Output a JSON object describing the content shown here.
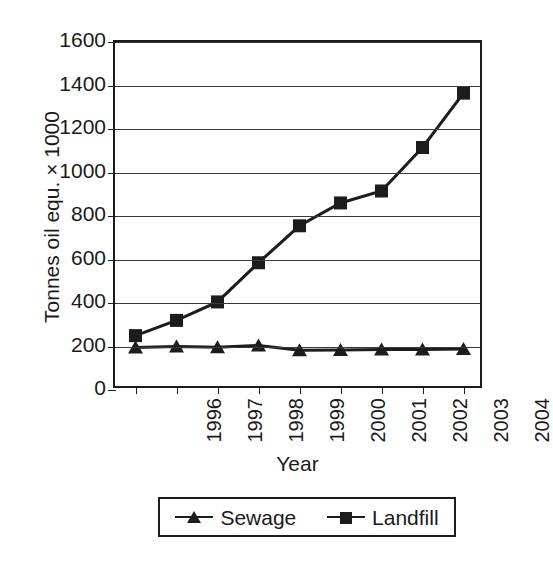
{
  "chart_data": {
    "type": "line",
    "title": "",
    "xlabel": "Year",
    "ylabel": "Tonnes oil equ. × 1000",
    "categories": [
      "1996",
      "1997",
      "1998",
      "1999",
      "2000",
      "2001",
      "2002",
      "2003",
      "2004"
    ],
    "series": [
      {
        "name": "Sewage",
        "marker": "triangle",
        "values": [
          195,
          200,
          197,
          205,
          183,
          184,
          186,
          186,
          188
        ]
      },
      {
        "name": "Landfill",
        "marker": "square",
        "values": [
          250,
          320,
          405,
          585,
          755,
          860,
          915,
          1115,
          1365
        ]
      }
    ],
    "ylim": [
      0,
      1600
    ],
    "yticks": [
      0,
      200,
      400,
      600,
      800,
      1000,
      1200,
      1400,
      1600
    ],
    "ytick_labels": [
      "0",
      "200",
      "400",
      "600",
      "800",
      "1000",
      "1200",
      "1400",
      "1600"
    ],
    "grid": true,
    "grid_axis": "y",
    "legend_position": "bottom",
    "line_color": "#1c1c1c",
    "background_color": "#ffffff",
    "frame": true
  },
  "legend": {
    "entries": [
      {
        "label": "Sewage",
        "marker": "triangle-marker"
      },
      {
        "label": "Landfill",
        "marker": "square-marker"
      }
    ]
  }
}
